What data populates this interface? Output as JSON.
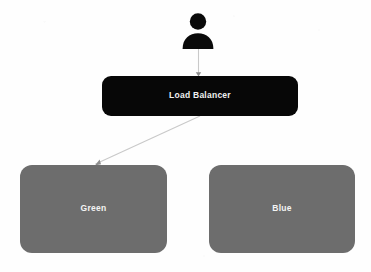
{
  "diagram": {
    "background_color": "#fefefe",
    "actor": {
      "icon": "user-person-icon",
      "color": "#0a0a0a"
    },
    "nodes": [
      {
        "id": "load-balancer",
        "label": "Load Balancer",
        "shape": "rounded-rectangle",
        "fill_color": "#070707",
        "text_color": "#f0f0f0"
      },
      {
        "id": "green",
        "label": "Green",
        "shape": "rounded-rectangle",
        "fill_color": "#6d6d6d",
        "text_color": "#f4f4f4"
      },
      {
        "id": "blue",
        "label": "Blue",
        "shape": "rounded-rectangle",
        "fill_color": "#6d6d6d",
        "text_color": "#f4f4f4"
      }
    ],
    "connectors": [
      {
        "id": "actor-to-load-balancer",
        "from": "actor",
        "to": "load-balancer",
        "style": "solid-arrow",
        "color": "#c9c9c9"
      },
      {
        "id": "load-balancer-to-green",
        "from": "load-balancer",
        "to": "green",
        "style": "solid-arrow",
        "color": "#c9c9c9"
      }
    ]
  }
}
